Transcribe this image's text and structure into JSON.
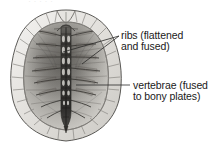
{
  "figure": {
    "title_cropped": "",
    "style": "grayscale-anatomical-illustration",
    "background_color": "#ffffff"
  },
  "labels": [
    {
      "id": "ribs",
      "name": "ribs-label",
      "line1": "ribs (flattened",
      "line2": "and fused)",
      "x": 121,
      "y1": 38,
      "y2": 49
    },
    {
      "id": "vertebrae",
      "name": "vertebrae-label",
      "line1": "vertebrae (fused",
      "line2": "to bony plates)",
      "x": 133,
      "y1": 88,
      "y2": 99
    }
  ],
  "leader_lines": [
    {
      "name": "leader-ribs-upper",
      "x1": 119,
      "y1": 36,
      "x2": 63,
      "y2": 52
    },
    {
      "name": "leader-ribs-lower",
      "x1": 119,
      "y1": 36,
      "x2": 80,
      "y2": 63
    },
    {
      "name": "leader-vertebrae",
      "x1": 130,
      "y1": 85,
      "x2": 76,
      "y2": 85
    }
  ],
  "colors": {
    "ink": "#1a1a1a",
    "shell_rim_light": "#f0efec",
    "shell_rim_mid": "#d8d6d1",
    "shell_interior_light": "#cfcdc8",
    "shell_interior_dark": "#6f6d69",
    "spine_dark": "#3a3936",
    "outline": "#4a4845",
    "plate_line": "#8a8884",
    "leader_line": "#2a2a28"
  },
  "anatomy": {
    "vertebra_count": 9,
    "marginal_plate_count": 22,
    "rib_pair_count": 8,
    "shell_center_x": 66,
    "shell_top_y": 10,
    "shell_bottom_y": 142
  }
}
